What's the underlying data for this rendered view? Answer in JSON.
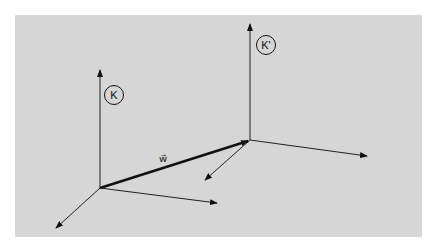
{
  "diagram": {
    "type": "coordinate-frames",
    "background_color": "#d6d6d6",
    "line_color": "#111111",
    "frames": [
      {
        "id": "K",
        "label": "K",
        "origin": [
          100,
          188
        ],
        "axes": {
          "vertical_tip": [
            100,
            70
          ],
          "horizontal_tip": [
            217,
            203
          ],
          "depth_tip": [
            56,
            228
          ]
        },
        "label_pos": [
          114,
          95
        ]
      },
      {
        "id": "K_prime",
        "label": "K'",
        "origin": [
          250,
          140
        ],
        "axes": {
          "vertical_tip": [
            250,
            24
          ],
          "horizontal_tip": [
            367,
            156
          ],
          "depth_tip": [
            205,
            180
          ]
        },
        "label_pos": [
          266,
          45
        ]
      }
    ],
    "vectors": [
      {
        "id": "w",
        "label": "w⃗",
        "from": [
          100,
          188
        ],
        "to": [
          250,
          140
        ],
        "label_pos": [
          163,
          160
        ],
        "weight": "thick"
      }
    ]
  }
}
